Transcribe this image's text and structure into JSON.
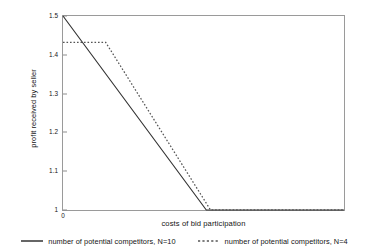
{
  "chart_data": {
    "type": "line",
    "title": "",
    "subtitle": "",
    "xlabel": "costs of bid participation",
    "ylabel": "profit received by seller",
    "xlim": [
      0,
      1
    ],
    "ylim": [
      1,
      1.5
    ],
    "grid": false,
    "legend_position": "bottom",
    "x_tick_labels": [
      "0"
    ],
    "x_tick_values": [
      0
    ],
    "y_tick_labels": [
      "1",
      "1.1",
      "1.2",
      "1.3",
      "1.4",
      "1.5"
    ],
    "y_tick_values": [
      1,
      1.1,
      1.2,
      1.3,
      1.4,
      1.5
    ],
    "series": [
      {
        "name": "number of potential competitors, N=10",
        "style": "solid",
        "color": "#333333",
        "points": [
          {
            "x": 0.0,
            "y": 1.5
          },
          {
            "x": 0.51,
            "y": 1.0
          },
          {
            "x": 1.0,
            "y": 1.0
          }
        ]
      },
      {
        "name": "number of potential competitors, N=4",
        "style": "dotted",
        "color": "#555555",
        "points": [
          {
            "x": 0.0,
            "y": 1.432
          },
          {
            "x": 0.152,
            "y": 1.432
          },
          {
            "x": 0.525,
            "y": 1.0
          },
          {
            "x": 1.0,
            "y": 1.0
          }
        ]
      }
    ],
    "legend": [
      {
        "label": "number of potential competitors, N=10",
        "style": "solid"
      },
      {
        "label": "number of potential competitors, N=4",
        "style": "dotted"
      }
    ]
  }
}
